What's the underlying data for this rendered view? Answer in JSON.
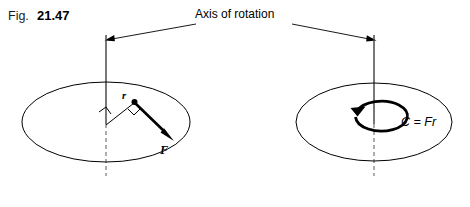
{
  "figure": {
    "caption_prefix": "Fig.",
    "caption_number": "21.47",
    "axis_label": "Axis of rotation"
  },
  "left_diagram": {
    "name": "force-applied-to-disc",
    "radius_label": "r",
    "force_label": "F",
    "icons": {
      "right_angle_axis": "right-angle-icon",
      "right_angle_force": "right-angle-icon",
      "point_mass": "point-dot-icon",
      "force_arrow": "arrow-icon"
    }
  },
  "right_diagram": {
    "name": "couple-on-disc",
    "couple_equation": "C = Fr",
    "icons": {
      "rotation_arrow": "circular-arrow-icon"
    }
  },
  "colors": {
    "background": "#ffffff",
    "ink": "#000000",
    "axis_solid": "#3f3f3f",
    "axis_dashed": "#8a8a8a"
  }
}
